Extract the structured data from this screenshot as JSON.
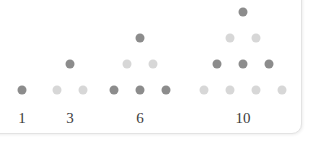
{
  "figure": {
    "kind": "triangular-number-dot-diagram",
    "background_color": "#ffffff",
    "panel": {
      "border_color": "#e3e3e3",
      "corner_radius_px": 10
    },
    "colors": {
      "dot_dark": "#8c8c8c",
      "dot_light": "#d7d7d7",
      "label_text": "#3b3b3b"
    },
    "dot_diameter_px": 9,
    "row_spacing_px": 26,
    "baseline_y_px": 90,
    "label_y_px": 111
  },
  "chart_data": {
    "type": "scatter",
    "title": "",
    "subtitle": "",
    "xlabel": "",
    "ylabel": "",
    "grid": false,
    "legend": null,
    "annotations": [],
    "categories": [
      "1",
      "3",
      "6",
      "10"
    ],
    "values": [
      1,
      3,
      6,
      10
    ],
    "x": [
      22,
      70,
      140,
      243
    ],
    "groups": [
      {
        "label": "1",
        "value": 1,
        "rows": 1,
        "center_x": 22,
        "label_x": 22,
        "dots": [
          {
            "x": 22,
            "y": 90,
            "shade": "dark",
            "row": 1
          }
        ]
      },
      {
        "label": "3",
        "value": 3,
        "rows": 2,
        "center_x": 70,
        "label_x": 70,
        "dots": [
          {
            "x": 70,
            "y": 64,
            "shade": "dark",
            "row": 1
          },
          {
            "x": 57,
            "y": 90,
            "shade": "light",
            "row": 2
          },
          {
            "x": 83,
            "y": 90,
            "shade": "light",
            "row": 2
          }
        ]
      },
      {
        "label": "6",
        "value": 6,
        "rows": 3,
        "center_x": 140,
        "label_x": 140,
        "dots": [
          {
            "x": 140,
            "y": 38,
            "shade": "dark",
            "row": 1
          },
          {
            "x": 127,
            "y": 64,
            "shade": "light",
            "row": 2
          },
          {
            "x": 153,
            "y": 64,
            "shade": "light",
            "row": 2
          },
          {
            "x": 114,
            "y": 90,
            "shade": "dark",
            "row": 3
          },
          {
            "x": 140,
            "y": 90,
            "shade": "dark",
            "row": 3
          },
          {
            "x": 166,
            "y": 90,
            "shade": "dark",
            "row": 3
          }
        ]
      },
      {
        "label": "10",
        "value": 10,
        "rows": 4,
        "center_x": 243,
        "label_x": 243,
        "dots": [
          {
            "x": 243,
            "y": 12,
            "shade": "dark",
            "row": 1
          },
          {
            "x": 230,
            "y": 38,
            "shade": "light",
            "row": 2
          },
          {
            "x": 256,
            "y": 38,
            "shade": "light",
            "row": 2
          },
          {
            "x": 217,
            "y": 64,
            "shade": "dark",
            "row": 3
          },
          {
            "x": 243,
            "y": 64,
            "shade": "dark",
            "row": 3
          },
          {
            "x": 269,
            "y": 64,
            "shade": "dark",
            "row": 3
          },
          {
            "x": 204,
            "y": 90,
            "shade": "light",
            "row": 4
          },
          {
            "x": 230,
            "y": 90,
            "shade": "light",
            "row": 4
          },
          {
            "x": 256,
            "y": 90,
            "shade": "light",
            "row": 4
          },
          {
            "x": 282,
            "y": 90,
            "shade": "light",
            "row": 4
          }
        ]
      }
    ]
  }
}
